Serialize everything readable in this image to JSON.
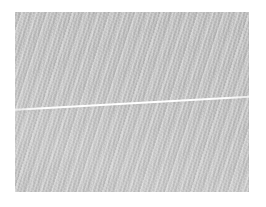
{
  "image": {
    "kind": "textured-surface-photograph",
    "canvas": {
      "width": 266,
      "height": 207,
      "background_color": "#ffffff"
    },
    "plate": {
      "label": "textured gray plate",
      "left": 15,
      "top": 12,
      "width": 234,
      "height": 180,
      "base_color": "#c2c2c2",
      "description": "Uniform fine diagonal weave filling the framed region"
    },
    "texture": {
      "pattern": "diagonal-stripes",
      "orientation": "top-right to bottom-left",
      "angle_deg": -72,
      "period_px": 3.5,
      "dark_tone": "#b4b4b4",
      "mid_tone": "#c1c1c1",
      "light_tone": "#cfcfcf"
    },
    "streak": {
      "label": "bright diagonal streak",
      "color": "#ffffff",
      "thickness_px": 1.5,
      "slope_deg": -3.2,
      "y_at_left_edge": 109,
      "y_at_right_edge": 96,
      "spans_full_width": true
    },
    "shading": {
      "note": "broad tonal gradient, lower-left marginally lighter",
      "direction_deg": 200
    },
    "text_content": {
      "has_text": false,
      "labels": [],
      "axes": [],
      "legend": []
    }
  }
}
